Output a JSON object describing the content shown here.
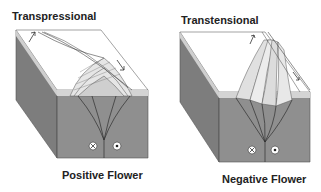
{
  "diagrams": [
    {
      "id": "transpressional",
      "title": "Transpressional",
      "caption": "Positive Flower",
      "symbols": [
        "into-page",
        "out-of-page"
      ]
    },
    {
      "id": "transtensional",
      "title": "Transtensional",
      "caption": "Negative Flower",
      "symbols": [
        "into-page",
        "out-of-page"
      ]
    }
  ],
  "colors": {
    "block_front": "#8c8c8c",
    "block_side": "#7a7a7a",
    "block_top": "#ffffff",
    "band_light": "#d6d6d6",
    "lines": "#333333"
  }
}
